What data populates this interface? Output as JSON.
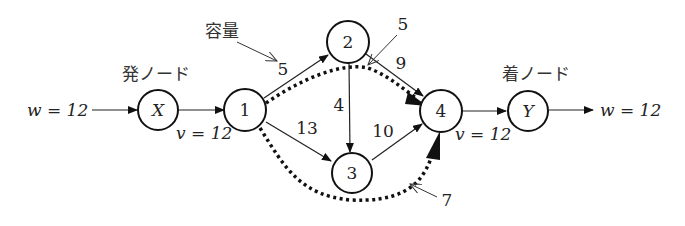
{
  "labels": {
    "source_node": "発ノード",
    "sink_node": "着ノード",
    "capacity": "容量",
    "w_in": "w = 12",
    "w_out": "w = 12",
    "v_source": "v = 12",
    "v_sink": "v = 12"
  },
  "nodes": {
    "X": "X",
    "n1": "1",
    "n2": "2",
    "n3": "3",
    "n4": "4",
    "Y": "Y"
  },
  "edges": {
    "e12": "5",
    "e13": "13",
    "e23": "4",
    "e24": "9",
    "e34": "10"
  },
  "flow_paths": {
    "top_path_label": "5",
    "bottom_path_label": "7"
  }
}
